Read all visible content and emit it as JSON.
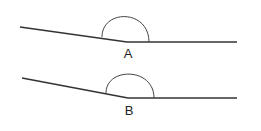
{
  "colors": {
    "background": "#ffffff",
    "line": "#333333",
    "arc": "#444444",
    "label": "#222222"
  },
  "figures": [
    {
      "label": "A",
      "left_ray_start": [
        20,
        27
      ],
      "vertex": [
        127,
        42
      ],
      "right_ray_end": [
        237,
        42
      ],
      "arc": {
        "start": [
          102,
          37
        ],
        "end": [
          149,
          42
        ],
        "top_y": 15
      },
      "label_pos": [
        128,
        47
      ]
    },
    {
      "label": "B",
      "left_ray_start": [
        22,
        78
      ],
      "vertex": [
        128,
        98
      ],
      "right_ray_end": [
        237,
        98
      ],
      "arc": {
        "start": [
          106,
          93
        ],
        "end": [
          154,
          98
        ],
        "top_y": 74
      },
      "label_pos": [
        129,
        104
      ]
    }
  ]
}
